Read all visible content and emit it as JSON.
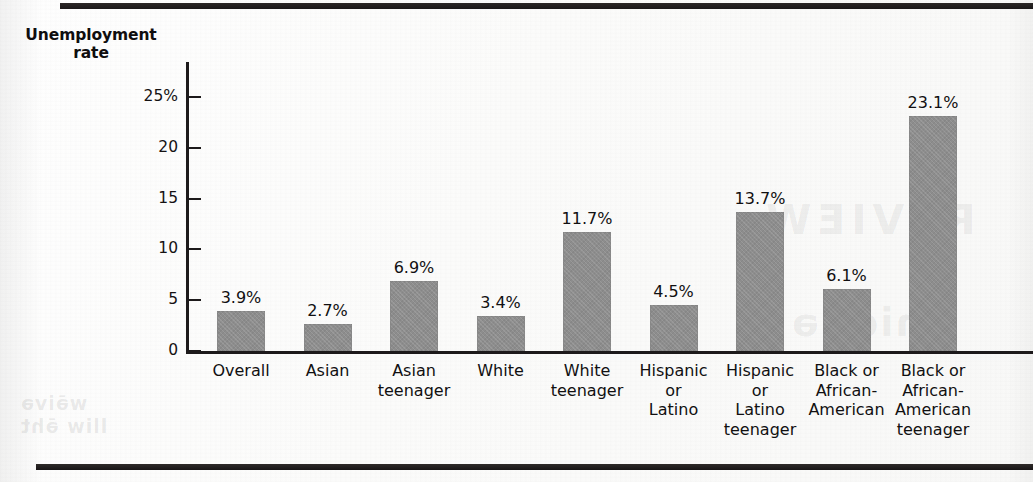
{
  "figure": {
    "background_color": "#fdfdfc",
    "ink_color": "#1d1a1b",
    "bar_color": "#8d8d8d"
  },
  "ghost_text": {
    "review": "REVIEW",
    "word": "gnidnə",
    "left_line_1": "wə̄ivə",
    "left_line_2": "lliw ə̄ht"
  },
  "chart_data": {
    "type": "bar",
    "title": "",
    "xlabel": "",
    "ylabel": "Unemployment rate",
    "ylabel_lines": [
      "Unemployment",
      "rate"
    ],
    "categories": [
      "Overall",
      "Asian",
      "Asian teenager",
      "White",
      "White teenager",
      "Hispanic or Latino",
      "Hispanic or Latino teenager",
      "Black or African-American",
      "Black or African-American teenager"
    ],
    "category_lines": [
      [
        "Overall"
      ],
      [
        "Asian"
      ],
      [
        "Asian",
        "teenager"
      ],
      [
        "White"
      ],
      [
        "White",
        "teenager"
      ],
      [
        "Hispanic",
        "or",
        "Latino"
      ],
      [
        "Hispanic",
        "or",
        "Latino",
        "teenager"
      ],
      [
        "Black or",
        "African-",
        "American"
      ],
      [
        "Black or",
        "African-",
        "American",
        "teenager"
      ]
    ],
    "values": [
      3.9,
      2.7,
      6.9,
      3.4,
      11.7,
      4.5,
      13.7,
      6.1,
      23.1
    ],
    "value_labels": [
      "3.9%",
      "2.7%",
      "6.9%",
      "3.4%",
      "11.7%",
      "4.5%",
      "13.7%",
      "6.1%",
      "23.1%"
    ],
    "ylim": [
      0,
      25
    ],
    "yticks": [
      0,
      5,
      10,
      15,
      20,
      25
    ],
    "ytick_labels": [
      "0",
      "5",
      "10",
      "15",
      "20",
      "25%"
    ],
    "grid": false,
    "legend": null
  }
}
